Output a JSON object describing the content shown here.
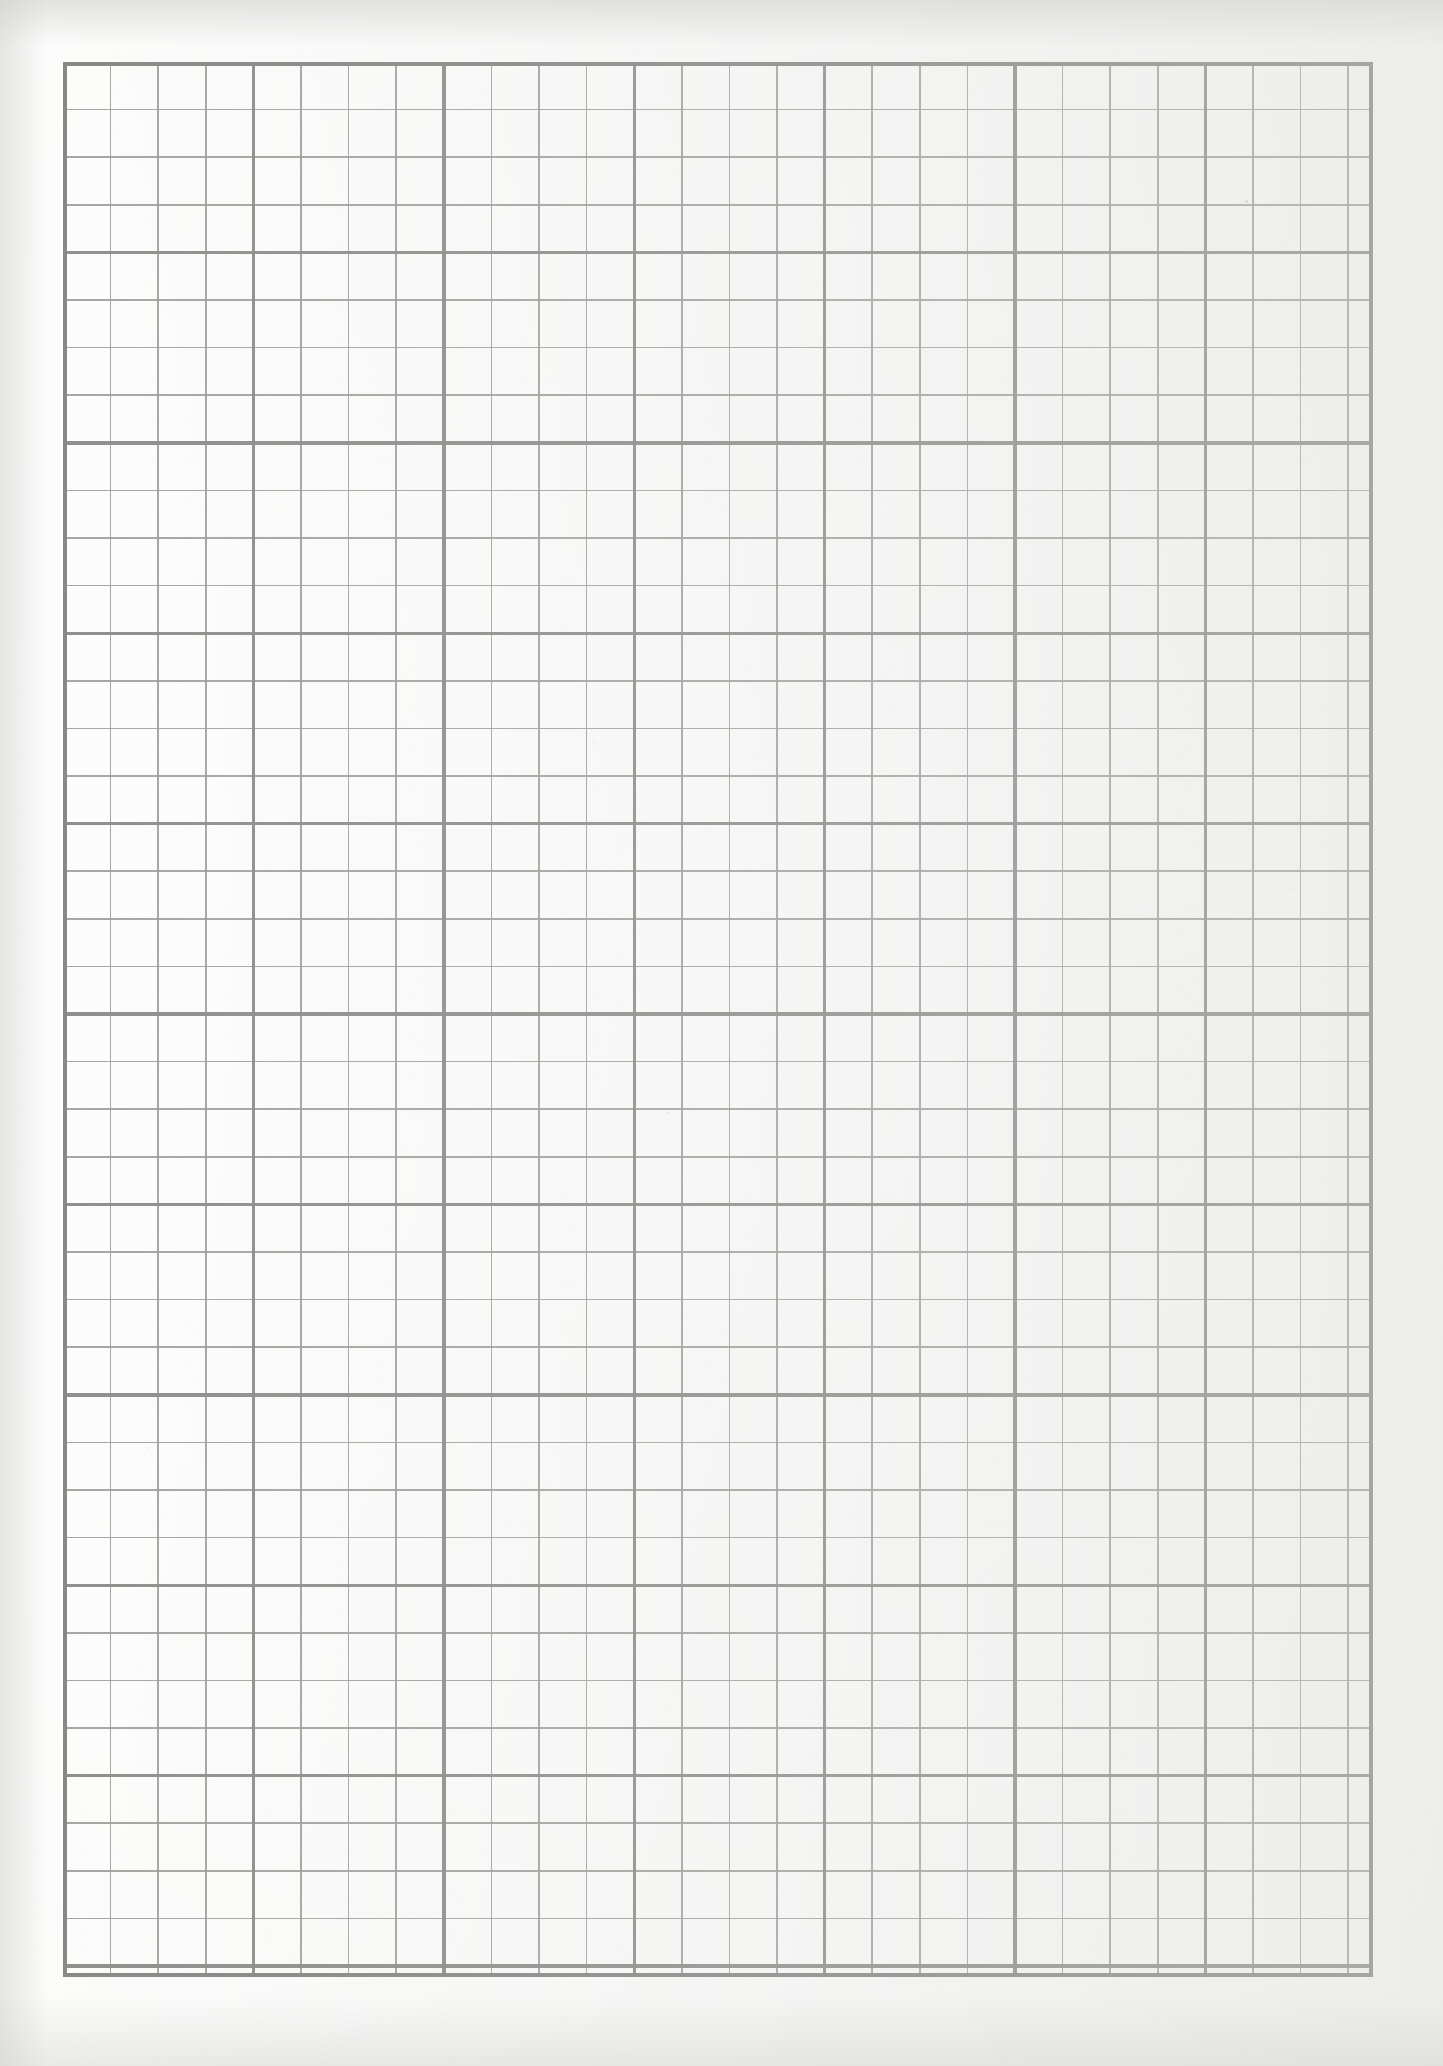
{
  "document": {
    "kind": "scanned-graph-paper",
    "sheet_label": "Graph paper sheet",
    "page_width": 1443,
    "page_height": 2066,
    "paper_color": "#fcfcfb",
    "page_background_color": "#ffffff"
  },
  "grid": {
    "name": "quad-ruled-graph-grid",
    "left": 63,
    "top": 62,
    "width": 1310,
    "height": 1915,
    "cell_size": 47.6,
    "columns": 27.5,
    "rows": 40.2,
    "major_every": 4,
    "minor_line_color": "#9d9d9b",
    "major_line_color": "#8a8a88",
    "border_line_color": "#878785",
    "minor_line_width": 1.6,
    "major_line_width": 3.4,
    "border_line_width": 4.0,
    "minor_opacity": 0.92,
    "major_opacity": 0.97
  },
  "specks": [
    {
      "x": 1245,
      "y": 200,
      "size": 3.0,
      "opacity": 0.55
    },
    {
      "x": 667,
      "y": 1112,
      "size": 2.4,
      "opacity": 0.42
    },
    {
      "x": 252,
      "y": 201,
      "size": 2.0,
      "opacity": 0.3
    },
    {
      "x": 593,
      "y": 741,
      "size": 1.8,
      "opacity": 0.26
    },
    {
      "x": 1290,
      "y": 888,
      "size": 1.8,
      "opacity": 0.24
    },
    {
      "x": 147,
      "y": 1447,
      "size": 1.8,
      "opacity": 0.24
    },
    {
      "x": 1193,
      "y": 1346,
      "size": 1.6,
      "opacity": 0.22
    },
    {
      "x": 444,
      "y": 634,
      "size": 1.6,
      "opacity": 0.22
    },
    {
      "x": 1031,
      "y": 1737,
      "size": 1.6,
      "opacity": 0.2
    }
  ]
}
